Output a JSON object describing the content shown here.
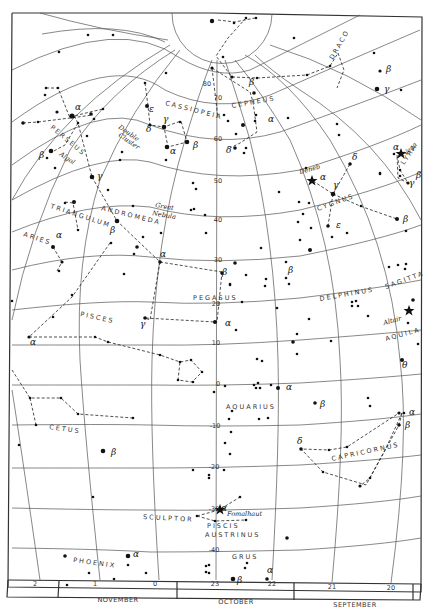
{
  "map": {
    "decl_labels": [
      {
        "text": "80",
        "x": 207,
        "y": 86
      },
      {
        "text": "70",
        "x": 218,
        "y": 100
      },
      {
        "text": "60",
        "x": 218,
        "y": 141
      },
      {
        "text": "50",
        "x": 218,
        "y": 183
      },
      {
        "text": "40",
        "x": 218,
        "y": 222
      },
      {
        "text": "30",
        "x": 218,
        "y": 262
      },
      {
        "text": "20",
        "x": 216,
        "y": 306
      },
      {
        "text": "10",
        "x": 216,
        "y": 345
      },
      {
        "text": "0",
        "x": 218,
        "y": 386
      },
      {
        "text": "-10",
        "x": 215,
        "y": 428
      },
      {
        "text": "-20",
        "x": 214,
        "y": 469
      },
      {
        "text": "-30",
        "x": 214,
        "y": 511
      },
      {
        "text": "-40",
        "x": 214,
        "y": 552
      }
    ],
    "ra_labels": [
      {
        "text": "2",
        "x": 35,
        "y": 586
      },
      {
        "text": "1",
        "x": 95,
        "y": 586
      },
      {
        "text": "0",
        "x": 155,
        "y": 586
      },
      {
        "text": "23",
        "x": 215,
        "y": 586
      },
      {
        "text": "22",
        "x": 272,
        "y": 586
      },
      {
        "text": "21",
        "x": 332,
        "y": 589
      },
      {
        "text": "20",
        "x": 391,
        "y": 590
      }
    ],
    "months": [
      {
        "text": "NOVEMBER",
        "x": 118,
        "y": 602
      },
      {
        "text": "OCTOBER",
        "x": 236,
        "y": 604
      },
      {
        "text": "SEPTEMBER",
        "x": 355,
        "y": 607
      }
    ],
    "constellations": [
      {
        "name": "CASSIOPEIA",
        "x": 165,
        "y": 105,
        "rot": 14
      },
      {
        "name": "CEPHEUS",
        "x": 232,
        "y": 108,
        "rot": -10
      },
      {
        "name": "DRACO",
        "x": 333,
        "y": 60,
        "rot": -60
      },
      {
        "name": "LYRA",
        "x": 404,
        "y": 165,
        "rot": -55
      },
      {
        "name": "PERSEUS",
        "x": 50,
        "y": 128,
        "rot": 40
      },
      {
        "name": "CYGNUS",
        "x": 318,
        "y": 211,
        "rot": -20
      },
      {
        "name": "TRIANGULUM",
        "x": 50,
        "y": 208,
        "rot": 18
      },
      {
        "name": "ANDROMEDA",
        "x": 101,
        "y": 210,
        "rot": 14
      },
      {
        "name": "ARIES",
        "x": 23,
        "y": 236,
        "rot": 18
      },
      {
        "name": "PEGASUS",
        "x": 193,
        "y": 300,
        "rot": 0
      },
      {
        "name": "DELPHINUS",
        "x": 320,
        "y": 301,
        "rot": -10
      },
      {
        "name": "SAGITTA",
        "x": 386,
        "y": 289,
        "rot": -20
      },
      {
        "name": "PISCES",
        "x": 80,
        "y": 316,
        "rot": 12
      },
      {
        "name": "AQUILA",
        "x": 386,
        "y": 341,
        "rot": -15
      },
      {
        "name": "AQUARIUS",
        "x": 226,
        "y": 409,
        "rot": 0
      },
      {
        "name": "CETUS",
        "x": 49,
        "y": 429,
        "rot": 8
      },
      {
        "name": "CAPRICORNUS",
        "x": 332,
        "y": 461,
        "rot": -12
      },
      {
        "name": "SCULPTOR",
        "x": 143,
        "y": 519,
        "rot": 3
      },
      {
        "name": "PISCIS",
        "x": 207,
        "y": 528,
        "rot": 0
      },
      {
        "name": "AUSTRINUS",
        "x": 205,
        "y": 537,
        "rot": 0
      },
      {
        "name": "GRUS",
        "x": 232,
        "y": 559,
        "rot": 0
      },
      {
        "name": "PHOENIX",
        "x": 73,
        "y": 562,
        "rot": 8
      }
    ],
    "star_names": [
      {
        "text": "Vega",
        "x": 406,
        "y": 156,
        "rot": -45
      },
      {
        "text": "Deneb",
        "x": 300,
        "y": 174,
        "rot": -15
      },
      {
        "text": "Algol",
        "x": 59,
        "y": 155,
        "rot": 35
      },
      {
        "text": "Double",
        "x": 118,
        "y": 128,
        "rot": 35
      },
      {
        "text": "Cluster",
        "x": 118,
        "y": 136,
        "rot": 35
      },
      {
        "text": "Great",
        "x": 155,
        "y": 207,
        "rot": 10
      },
      {
        "text": "Nebula",
        "x": 152,
        "y": 215,
        "rot": 10
      },
      {
        "text": "Altair",
        "x": 384,
        "y": 325,
        "rot": -15
      },
      {
        "text": "Fomalhaut",
        "x": 227,
        "y": 516,
        "rot": 0
      }
    ],
    "greek": [
      {
        "t": "α",
        "x": 75,
        "y": 110
      },
      {
        "t": "β",
        "x": 39,
        "y": 158
      },
      {
        "t": "γ",
        "x": 97,
        "y": 179
      },
      {
        "t": "ε",
        "x": 149,
        "y": 112
      },
      {
        "t": "δ",
        "x": 146,
        "y": 132
      },
      {
        "t": "γ",
        "x": 163,
        "y": 122
      },
      {
        "t": "α",
        "x": 170,
        "y": 154
      },
      {
        "t": "β",
        "x": 193,
        "y": 148
      },
      {
        "t": "β",
        "x": 249,
        "y": 85
      },
      {
        "t": "α",
        "x": 268,
        "y": 122
      },
      {
        "t": "δ",
        "x": 226,
        "y": 153
      },
      {
        "t": "β",
        "x": 386,
        "y": 72
      },
      {
        "t": "γ",
        "x": 384,
        "y": 92
      },
      {
        "t": "α",
        "x": 393,
        "y": 150
      },
      {
        "t": "β",
        "x": 416,
        "y": 178
      },
      {
        "t": "γ",
        "x": 409,
        "y": 186
      },
      {
        "t": "α",
        "x": 320,
        "y": 180
      },
      {
        "t": "γ",
        "x": 333,
        "y": 188
      },
      {
        "t": "δ",
        "x": 352,
        "y": 160
      },
      {
        "t": "ε",
        "x": 336,
        "y": 228
      },
      {
        "t": "β",
        "x": 403,
        "y": 222
      },
      {
        "t": "α",
        "x": 56,
        "y": 238
      },
      {
        "t": "β",
        "x": 110,
        "y": 233
      },
      {
        "t": "α",
        "x": 160,
        "y": 257
      },
      {
        "t": "β",
        "x": 288,
        "y": 273
      },
      {
        "t": "β",
        "x": 222,
        "y": 275
      },
      {
        "t": "α",
        "x": 225,
        "y": 326
      },
      {
        "t": "γ",
        "x": 140,
        "y": 327
      },
      {
        "t": "α",
        "x": 30,
        "y": 345
      },
      {
        "t": "θ",
        "x": 402,
        "y": 368
      },
      {
        "t": "α",
        "x": 286,
        "y": 390
      },
      {
        "t": "β",
        "x": 320,
        "y": 407
      },
      {
        "t": "α",
        "x": 409,
        "y": 415
      },
      {
        "t": "β",
        "x": 405,
        "y": 428
      },
      {
        "t": "δ",
        "x": 297,
        "y": 444
      },
      {
        "t": "β",
        "x": 111,
        "y": 455
      },
      {
        "t": "α",
        "x": 221,
        "y": 511
      },
      {
        "t": "β",
        "x": 237,
        "y": 583
      },
      {
        "t": "α",
        "x": 267,
        "y": 573
      },
      {
        "t": "α",
        "x": 133,
        "y": 557
      }
    ]
  },
  "chart_data": {
    "type": "star-map",
    "declination_lines": [
      80,
      70,
      60,
      50,
      40,
      30,
      20,
      10,
      0,
      -10,
      -20,
      -30,
      -40
    ],
    "right_ascension_hours": [
      2,
      1,
      0,
      23,
      22,
      21,
      20
    ],
    "months": [
      "NOVEMBER",
      "OCTOBER",
      "SEPTEMBER"
    ],
    "named_stars": [
      "Vega",
      "Deneb",
      "Algol",
      "Altair",
      "Fomalhaut"
    ],
    "deep_sky": [
      "Double Cluster",
      "Great Nebula"
    ],
    "constellations": [
      "Cassiopeia",
      "Cepheus",
      "Draco",
      "Lyra",
      "Perseus",
      "Cygnus",
      "Triangulum",
      "Andromeda",
      "Aries",
      "Pegasus",
      "Delphinus",
      "Sagitta",
      "Pisces",
      "Aquila",
      "Aquarius",
      "Cetus",
      "Capricornus",
      "Sculptor",
      "Piscis Austrinus",
      "Grus",
      "Phoenix"
    ]
  }
}
